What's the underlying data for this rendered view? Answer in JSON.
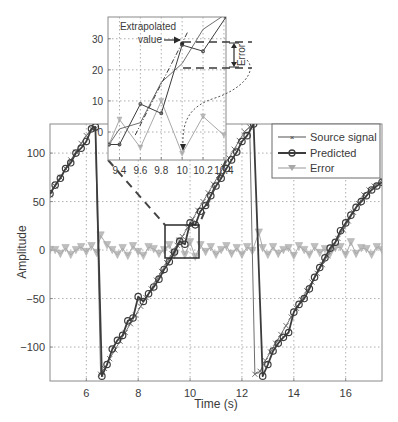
{
  "chart_data": [
    {
      "type": "line",
      "title": "",
      "xlabel": "Time (s)",
      "ylabel": "Amplitude",
      "xlim": [
        4.6,
        17.4
      ],
      "ylim": [
        -135,
        130
      ],
      "xticks": [
        6,
        8,
        10,
        12,
        14,
        16
      ],
      "yticks": [
        -100,
        -50,
        0,
        50,
        100
      ],
      "xtick_labels": [
        "6",
        "8",
        "10",
        "12",
        "14",
        "16"
      ],
      "ytick_labels": [
        "−100",
        "−50",
        "0",
        "50",
        "100"
      ],
      "grid": true,
      "legend_position": "upper right",
      "legend": [
        "Source signal",
        "Predicted",
        "Error"
      ],
      "series": [
        {
          "name": "Source signal",
          "color": "#6e6e6e",
          "marker": "x",
          "x": [
            4.6,
            4.8,
            5.0,
            5.2,
            5.4,
            5.6,
            5.8,
            6.0,
            6.2,
            6.35,
            6.55,
            6.7,
            6.9,
            7.1,
            7.3,
            7.5,
            7.7,
            7.9,
            8.1,
            8.3,
            8.5,
            8.7,
            8.9,
            9.1,
            9.3,
            9.5,
            9.7,
            9.9,
            10.1,
            10.3,
            10.5,
            10.7,
            10.9,
            11.1,
            11.3,
            11.5,
            11.7,
            11.9,
            12.1,
            12.3,
            12.5,
            12.7,
            12.9,
            13.1,
            13.3,
            13.5,
            13.7,
            13.9,
            14.1,
            14.3,
            14.5,
            14.7,
            14.9,
            15.1,
            15.3,
            15.5,
            15.7,
            15.9,
            16.1,
            16.3,
            16.5,
            16.7,
            16.9,
            17.1,
            17.4
          ],
          "y": [
            57,
            66,
            75,
            84,
            93,
            101,
            110,
            118,
            125,
            125,
            -128,
            -122,
            -112,
            -103,
            -94,
            -85,
            -76,
            -67,
            -58,
            -49,
            -40,
            -31,
            -22,
            -13,
            -4,
            5,
            14,
            23,
            32,
            41,
            50,
            59,
            68,
            77,
            86,
            95,
            104,
            113,
            122,
            127,
            -128,
            -125,
            -114,
            -105,
            -96,
            -87,
            -78,
            -69,
            -60,
            -51,
            -42,
            -33,
            -24,
            -15,
            -6,
            3,
            12,
            21,
            30,
            39,
            48,
            57,
            62,
            66,
            72
          ]
        },
        {
          "name": "Predicted",
          "color": "#3c3c3c",
          "marker": "o",
          "x": [
            4.6,
            4.8,
            5.0,
            5.2,
            5.4,
            5.6,
            5.8,
            6.0,
            6.2,
            6.35,
            6.6,
            6.8,
            7.0,
            7.2,
            7.4,
            7.6,
            7.8,
            8.0,
            8.2,
            8.4,
            8.6,
            8.8,
            9.0,
            9.2,
            9.4,
            9.6,
            9.8,
            10.0,
            10.2,
            10.4,
            10.6,
            10.8,
            11.0,
            11.2,
            11.4,
            11.6,
            11.8,
            12.0,
            12.2,
            12.45,
            12.8,
            13.0,
            13.2,
            13.4,
            13.6,
            13.8,
            14.0,
            14.2,
            14.4,
            14.6,
            14.8,
            15.0,
            15.2,
            15.4,
            15.6,
            15.8,
            16.0,
            16.2,
            16.4,
            16.6,
            16.8,
            17.0,
            17.2,
            17.4
          ],
          "y": [
            58,
            67,
            74,
            84,
            90,
            100,
            105,
            112,
            125,
            127,
            -130,
            -118,
            -102,
            -93,
            -88,
            -73,
            -70,
            -48,
            -53,
            -45,
            -38,
            -30,
            -20,
            -12,
            -2,
            9,
            6,
            28,
            26,
            40,
            46,
            56,
            66,
            74,
            84,
            93,
            101,
            112,
            118,
            130,
            -130,
            -118,
            -104,
            -96,
            -90,
            -85,
            -64,
            -56,
            -50,
            -40,
            -28,
            -18,
            -8,
            2,
            8,
            20,
            28,
            36,
            44,
            50,
            56,
            62,
            66,
            70
          ]
        },
        {
          "name": "Error",
          "color": "#a8a8a8",
          "marker": "v",
          "x": [
            4.6,
            4.8,
            5.0,
            5.2,
            5.4,
            5.6,
            5.8,
            6.0,
            6.2,
            6.4,
            6.55,
            6.8,
            7.0,
            7.2,
            7.4,
            7.6,
            7.8,
            8.0,
            8.2,
            8.4,
            8.6,
            8.8,
            9.0,
            9.2,
            9.4,
            9.6,
            9.8,
            10.0,
            10.2,
            10.4,
            10.6,
            10.8,
            11.0,
            11.2,
            11.4,
            11.6,
            11.8,
            12.0,
            12.2,
            12.4,
            12.65,
            12.8,
            13.0,
            13.2,
            13.4,
            13.6,
            13.8,
            14.0,
            14.2,
            14.4,
            14.6,
            14.8,
            15.0,
            15.2,
            15.4,
            15.6,
            15.8,
            16.0,
            16.2,
            16.4,
            16.6,
            16.8,
            17.0,
            17.2,
            17.4
          ],
          "y": [
            0,
            0,
            -4,
            2,
            -5,
            0,
            3,
            -2,
            4,
            -3,
            15,
            5,
            0,
            -5,
            2,
            -6,
            4,
            -2,
            -6,
            3,
            1,
            -4,
            0,
            5,
            -5,
            9,
            -5,
            8,
            -7,
            5,
            -2,
            3,
            -5,
            0,
            4,
            -4,
            2,
            -5,
            3,
            -1,
            18,
            2,
            -5,
            3,
            -4,
            0,
            2,
            -6,
            4,
            0,
            -5,
            3,
            -3,
            1,
            -4,
            2,
            3,
            -5,
            8,
            -4,
            2,
            1,
            -5,
            3,
            0
          ]
        }
      ],
      "annotations": {
        "zoom_box": {
          "x": [
            9.02,
            10.33
          ],
          "y": [
            -7,
            27
          ]
        }
      }
    },
    {
      "type": "line",
      "title": "Inset (zoom)",
      "xlim": [
        9.29,
        10.42
      ],
      "ylim": [
        -9,
        37
      ],
      "xticks": [
        9.4,
        9.6,
        9.8,
        10.0,
        10.2,
        10.4
      ],
      "yticks": [
        0,
        10,
        20,
        30
      ],
      "xtick_labels": [
        "9.4",
        "9.6",
        "9.8",
        "10",
        "10.2",
        "10.4"
      ],
      "ytick_labels": [
        "0",
        "10",
        "20",
        "30"
      ],
      "grid": true,
      "series": [
        {
          "name": "Source signal",
          "color": "#6e6e6e",
          "x": [
            9.3,
            9.4,
            9.6,
            9.8,
            10.0,
            10.2,
            10.42
          ],
          "y": [
            -4,
            1,
            3,
            16,
            22,
            33,
            38
          ]
        },
        {
          "name": "Predicted",
          "color": "#3c3c3c",
          "x": [
            9.3,
            9.4,
            9.6,
            9.8,
            10.0,
            10.2,
            10.42
          ],
          "y": [
            -4,
            -4,
            9,
            6,
            28,
            26,
            37
          ]
        },
        {
          "name": "Error",
          "color": "#a8a8a8",
          "x": [
            9.3,
            9.4,
            9.6,
            9.8,
            10.0,
            10.2,
            10.4
          ],
          "y": [
            -4,
            4,
            -5,
            10,
            -7,
            5,
            -1
          ]
        },
        {
          "name": "Extrapolation",
          "color": "#3c3c3c",
          "style": "dash-dot",
          "x": [
            9.55,
            10.05
          ],
          "y": [
            -1,
            32
          ]
        }
      ],
      "annotations": {
        "extrapolated_label": "Extrapolated\nvalue",
        "extrapolated_point": {
          "x": 10.0,
          "y": 28.5
        },
        "error_label": "Error",
        "error_range": [
          20.5,
          28.5
        ]
      }
    }
  ],
  "labels": {
    "xlabel": "Time (s)",
    "ylabel": "Amplitude",
    "legend": [
      "Source signal",
      "Predicted",
      "Error"
    ],
    "inset_line1": "Extrapolated",
    "inset_line2": "value",
    "error": "Error"
  }
}
